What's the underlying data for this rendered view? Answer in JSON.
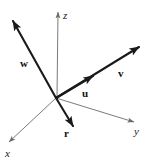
{
  "figure": {
    "background_color": "#ffffff",
    "width": 150,
    "height": 166,
    "origin": {
      "x": 56,
      "y": 98
    }
  },
  "axes": {
    "color": "#6b6b6b",
    "stroke_width": 0.9,
    "items": [
      {
        "name": "z",
        "label": "z",
        "label_x": 63,
        "label_y": 10,
        "x1": 57,
        "y1": 97,
        "x2": 58,
        "y2": 12,
        "arrow": "end"
      },
      {
        "name": "y",
        "label": "y",
        "label_x": 134,
        "label_y": 126,
        "x1": 56,
        "y1": 98,
        "x2": 134,
        "y2": 122,
        "arrow": "end"
      },
      {
        "name": "x",
        "label": "x",
        "label_x": 5,
        "label_y": 148,
        "x1": 56,
        "y1": 98,
        "x2": 9,
        "y2": 142,
        "arrow": "end"
      }
    ]
  },
  "vectors": {
    "color": "#1a1a1a",
    "stroke_width": 2.1,
    "items": [
      {
        "name": "w",
        "label": "w",
        "label_x": 20,
        "label_y": 58,
        "x1": 56,
        "y1": 98,
        "x2": 13,
        "y2": 21,
        "arrow": "end"
      },
      {
        "name": "v",
        "label": "v",
        "label_x": 118,
        "label_y": 68,
        "x1": 56,
        "y1": 98,
        "x2": 139,
        "y2": 47,
        "arrow": "end"
      },
      {
        "name": "u",
        "label": "u",
        "label_x": 82,
        "label_y": 88,
        "x1": 56,
        "y1": 98,
        "x2": 93,
        "y2": 76,
        "arrow": "end"
      },
      {
        "name": "r",
        "label": "r",
        "label_x": 64,
        "label_y": 128,
        "x1": 56,
        "y1": 98,
        "x2": 73,
        "y2": 126,
        "arrow": "end"
      }
    ]
  }
}
